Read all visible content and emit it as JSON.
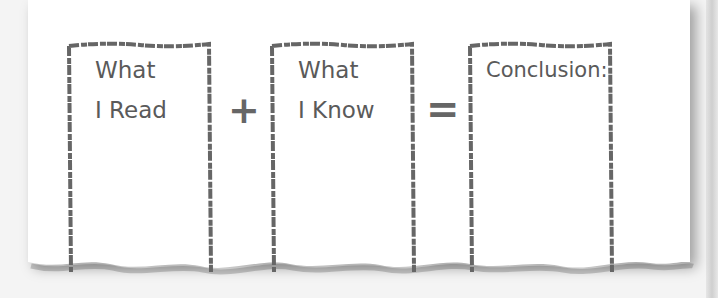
{
  "diagram": {
    "boxes": [
      {
        "line1": "What",
        "line2": "I Read"
      },
      {
        "line1": "What",
        "line2": "I Know"
      },
      {
        "line1": "Conclusion:",
        "line2": ""
      }
    ],
    "operators": {
      "plus": "+",
      "equals": "="
    },
    "colors": {
      "border": "#666666",
      "text": "#5a5a5a",
      "paper": "#ffffff"
    }
  }
}
